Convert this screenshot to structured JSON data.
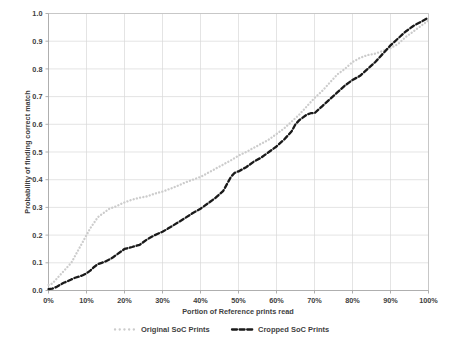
{
  "chart_data": {
    "type": "line",
    "title": "",
    "xlabel": "Portion of Reference prints read",
    "ylabel": "Probability of finding correct match",
    "xlim": [
      0,
      100
    ],
    "ylim": [
      0,
      1.0
    ],
    "grid": true,
    "legend_position": "bottom",
    "x_tick_labels": [
      "0%",
      "10%",
      "20%",
      "30%",
      "40%",
      "50%",
      "60%",
      "70%",
      "80%",
      "90%",
      "100%"
    ],
    "x_tick_values": [
      0,
      10,
      20,
      30,
      40,
      50,
      60,
      70,
      80,
      90,
      100
    ],
    "y_tick_labels": [
      "0.0",
      "0.1",
      "0.2",
      "0.3",
      "0.4",
      "0.5",
      "0.6",
      "0.7",
      "0.8",
      "0.9",
      "1.0"
    ],
    "y_tick_values": [
      0.0,
      0.1,
      0.2,
      0.3,
      0.4,
      0.5,
      0.6,
      0.7,
      0.8,
      0.9,
      1.0
    ],
    "series": [
      {
        "name": "Original SoC Prints",
        "color": "#cccccc",
        "style": "dotted",
        "x": [
          0,
          1,
          2,
          3,
          4,
          5,
          6,
          7,
          8,
          9,
          10,
          11,
          12,
          13,
          14,
          15,
          16,
          17,
          18,
          19,
          20,
          22,
          24,
          26,
          28,
          30,
          32,
          34,
          36,
          38,
          40,
          42,
          44,
          46,
          48,
          50,
          52,
          54,
          56,
          58,
          60,
          62,
          64,
          66,
          68,
          70,
          72,
          74,
          76,
          78,
          80,
          82,
          84,
          86,
          88,
          90,
          92,
          94,
          96,
          98,
          100
        ],
        "y": [
          0.02,
          0.025,
          0.04,
          0.055,
          0.07,
          0.085,
          0.1,
          0.125,
          0.15,
          0.175,
          0.2,
          0.225,
          0.245,
          0.265,
          0.275,
          0.285,
          0.295,
          0.3,
          0.305,
          0.312,
          0.318,
          0.328,
          0.335,
          0.34,
          0.35,
          0.357,
          0.367,
          0.378,
          0.39,
          0.4,
          0.41,
          0.425,
          0.44,
          0.455,
          0.47,
          0.487,
          0.5,
          0.515,
          0.53,
          0.545,
          0.565,
          0.585,
          0.61,
          0.635,
          0.665,
          0.695,
          0.72,
          0.75,
          0.78,
          0.8,
          0.825,
          0.84,
          0.85,
          0.855,
          0.865,
          0.875,
          0.89,
          0.915,
          0.935,
          0.955,
          0.975
        ]
      },
      {
        "name": "Cropped SoC Prints",
        "color": "#1a1a1a",
        "style": "dashed",
        "x": [
          0,
          1,
          2,
          3,
          4,
          5,
          6,
          7,
          8,
          9,
          10,
          11,
          12,
          13,
          14,
          15,
          16,
          17,
          18,
          20,
          22,
          24,
          25,
          26,
          28,
          30,
          32,
          34,
          36,
          38,
          40,
          42,
          44,
          46,
          48,
          49,
          50,
          52,
          54,
          56,
          58,
          60,
          62,
          64,
          65,
          66,
          68,
          69,
          70,
          72,
          74,
          76,
          78,
          80,
          82,
          84,
          86,
          88,
          90,
          92,
          94,
          96,
          98,
          100
        ],
        "y": [
          0.005,
          0.007,
          0.012,
          0.02,
          0.028,
          0.033,
          0.04,
          0.046,
          0.05,
          0.055,
          0.062,
          0.072,
          0.085,
          0.095,
          0.1,
          0.105,
          0.112,
          0.12,
          0.13,
          0.15,
          0.157,
          0.165,
          0.175,
          0.185,
          0.2,
          0.212,
          0.228,
          0.245,
          0.262,
          0.28,
          0.295,
          0.315,
          0.335,
          0.36,
          0.41,
          0.425,
          0.43,
          0.445,
          0.465,
          0.48,
          0.5,
          0.52,
          0.545,
          0.575,
          0.6,
          0.615,
          0.635,
          0.64,
          0.64,
          0.665,
          0.69,
          0.715,
          0.74,
          0.76,
          0.775,
          0.8,
          0.825,
          0.855,
          0.885,
          0.91,
          0.935,
          0.955,
          0.97,
          0.985
        ]
      }
    ],
    "legend": [
      {
        "label": "Original SoC Prints",
        "color": "#cccccc",
        "style": "dotted"
      },
      {
        "label": "Cropped SoC Prints",
        "color": "#1a1a1a",
        "style": "dashed"
      }
    ]
  },
  "colors": {
    "background": "#ffffff",
    "grid": "#d9d9d9",
    "frame": "#bfbfbf",
    "text": "#3f3f3f",
    "series_original": "#cccccc",
    "series_cropped": "#1a1a1a"
  }
}
